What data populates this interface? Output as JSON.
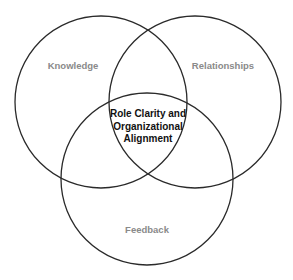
{
  "diagram": {
    "type": "venn",
    "circles": [
      {
        "id": "knowledge",
        "label": "Knowledge",
        "cx": 101,
        "cy": 102,
        "r": 86
      },
      {
        "id": "relationships",
        "label": "Relationships",
        "cx": 195,
        "cy": 102,
        "r": 86
      },
      {
        "id": "feedback",
        "label": "Feedback",
        "cx": 147,
        "cy": 179,
        "r": 86
      }
    ],
    "center_label": {
      "line1": "Role Clarity and",
      "line2": "Organizational",
      "line3": "Alignment"
    },
    "colors": {
      "stroke": "#2a2a2a",
      "outer_label": "#8a8a8a",
      "center_label": "#111111",
      "background": "#ffffff"
    }
  }
}
